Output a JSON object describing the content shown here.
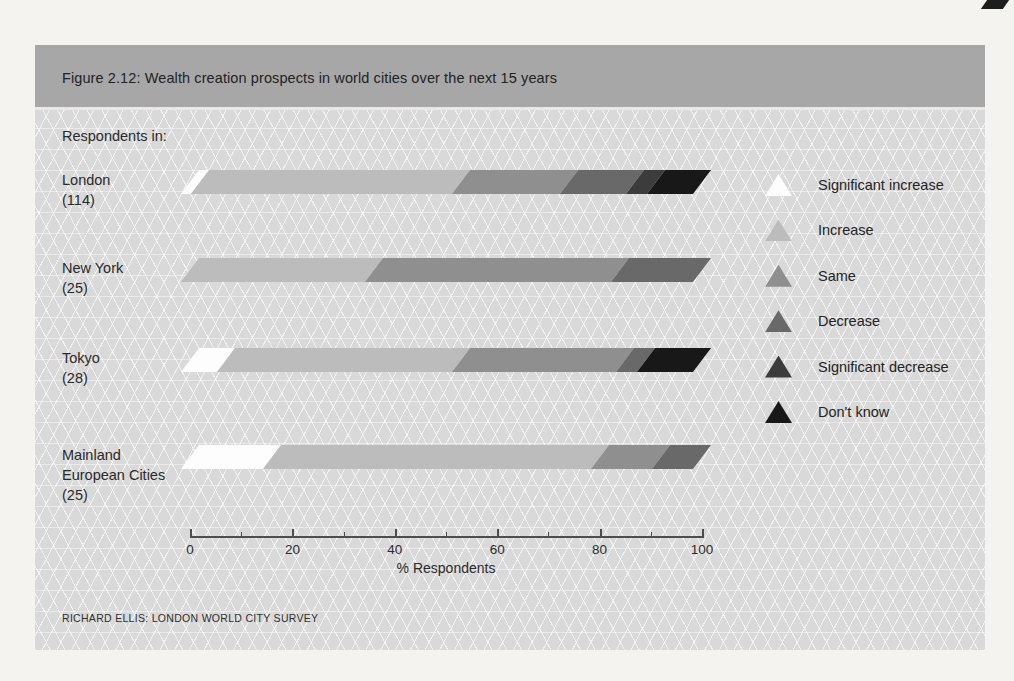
{
  "figure": {
    "title": "Figure 2.12: Wealth creation prospects in world cities over the next 15 years",
    "respondents_label": "Respondents in:",
    "source": "RICHARD ELLIS: LONDON WORLD CITY SURVEY"
  },
  "chart_data": {
    "type": "bar",
    "orientation": "horizontal",
    "stacked": true,
    "title": "Figure 2.12: Wealth creation prospects in world cities over the next 15 years",
    "xlabel": "% Respondents",
    "xlim": [
      0,
      100
    ],
    "x_ticks": [
      0,
      20,
      40,
      60,
      80,
      100
    ],
    "x_minor_ticks": [
      10,
      30,
      50,
      70,
      90
    ],
    "grid": false,
    "legend_position": "right",
    "categories": [
      "London (114)",
      "New York (25)",
      "Tokyo (28)",
      "Mainland European Cities (25)"
    ],
    "row_labels": [
      [
        "London",
        "(114)"
      ],
      [
        "New York",
        "(25)"
      ],
      [
        "Tokyo",
        "(28)"
      ],
      [
        "Mainland",
        "European Cities",
        "(25)"
      ]
    ],
    "series": [
      {
        "name": "Significant increase",
        "color": "#fdfdfd",
        "values": [
          2,
          0,
          7,
          16
        ]
      },
      {
        "name": "Increase",
        "color": "#bcbcbc",
        "values": [
          51,
          36,
          46,
          64
        ]
      },
      {
        "name": "Same",
        "color": "#8f8f8f",
        "values": [
          21,
          48,
          32,
          12
        ]
      },
      {
        "name": "Decrease",
        "color": "#696969",
        "values": [
          13,
          16,
          4,
          8
        ]
      },
      {
        "name": "Significant decrease",
        "color": "#3c3c3c",
        "values": [
          4,
          0,
          0,
          0
        ]
      },
      {
        "name": "Don't know",
        "color": "#181818",
        "values": [
          9,
          0,
          11,
          0
        ]
      }
    ],
    "legend": [
      {
        "label": "Significant increase",
        "color": "#fdfdfd"
      },
      {
        "label": "Increase",
        "color": "#bcbcbc"
      },
      {
        "label": "Same",
        "color": "#8f8f8f"
      },
      {
        "label": "Decrease",
        "color": "#696969"
      },
      {
        "label": "Significant decrease",
        "color": "#3c3c3c"
      },
      {
        "label": "Don't know",
        "color": "#181818"
      }
    ]
  }
}
